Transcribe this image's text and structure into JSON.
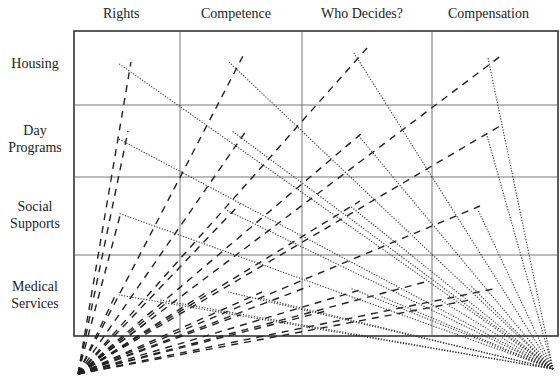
{
  "columns": [
    {
      "label": "Rights",
      "center_x": 127
    },
    {
      "label": "Competence",
      "center_x": 241
    },
    {
      "label": "Who Decides?",
      "center_x": 367
    },
    {
      "label": "Compensation",
      "center_x": 495
    }
  ],
  "rows": [
    {
      "label_line1": "Housing",
      "label_line2": "",
      "top": 55
    },
    {
      "label_line1": "Day",
      "label_line2": "Programs",
      "top": 122
    },
    {
      "label_line1": "Social",
      "label_line2": "Supports",
      "top": 198
    },
    {
      "label_line1": "Medical",
      "label_line2": "Services",
      "top": 278
    }
  ],
  "grid": {
    "left": 74,
    "top": 31,
    "right": 558,
    "bottom": 336,
    "col_dividers": [
      180,
      302,
      432
    ],
    "row_dividers": [
      105,
      177,
      255
    ]
  },
  "dashed_origin": {
    "x": 78,
    "y": 374
  },
  "dotted_origin": {
    "x": 553,
    "y": 369
  },
  "dashed_endpoints": [
    [
      131,
      62
    ],
    [
      245,
      52
    ],
    [
      367,
      48
    ],
    [
      502,
      55
    ],
    [
      128,
      131
    ],
    [
      246,
      131
    ],
    [
      362,
      133
    ],
    [
      500,
      126
    ],
    [
      121,
      212
    ],
    [
      240,
      204
    ],
    [
      360,
      201
    ],
    [
      480,
      206
    ],
    [
      115,
      296
    ],
    [
      210,
      290
    ],
    [
      310,
      286
    ],
    [
      425,
      282
    ],
    [
      170,
      300
    ],
    [
      262,
      292
    ],
    [
      360,
      290
    ],
    [
      498,
      288
    ],
    [
      150,
      320
    ],
    [
      240,
      315
    ],
    [
      330,
      310
    ],
    [
      470,
      300
    ]
  ],
  "dotted_endpoints": [
    [
      118,
      63
    ],
    [
      229,
      62
    ],
    [
      354,
      53
    ],
    [
      488,
      58
    ],
    [
      117,
      138
    ],
    [
      232,
      131
    ],
    [
      358,
      135
    ],
    [
      486,
      132
    ],
    [
      118,
      213
    ],
    [
      226,
      210
    ],
    [
      350,
      206
    ],
    [
      478,
      210
    ],
    [
      119,
      295
    ],
    [
      228,
      292
    ],
    [
      350,
      288
    ],
    [
      470,
      285
    ],
    [
      160,
      300
    ],
    [
      260,
      298
    ],
    [
      380,
      296
    ],
    [
      440,
      300
    ]
  ]
}
